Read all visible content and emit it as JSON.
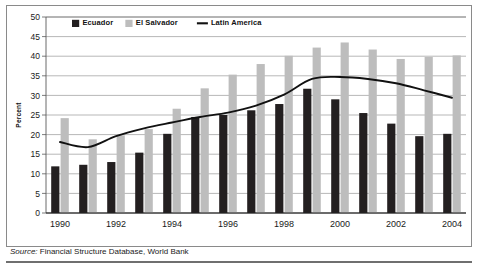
{
  "figure": {
    "source_prefix": "Source:",
    "source_text": " Financial Structure Database, World Bank"
  },
  "colors": {
    "ecuador": "#231f20",
    "el_salvador": "#bdbdbd",
    "latin_america": "#111111",
    "gridline": "#9a9a9a",
    "axis": "#5a5a5a",
    "frame": "#8a8a8a",
    "background": "#ffffff"
  },
  "chart_data": {
    "type": "bar",
    "title": "",
    "subtitle": "",
    "xlabel": "",
    "ylabel": "Percent",
    "ylim": [
      0,
      50
    ],
    "ytick_step": 5,
    "yticks": [
      0,
      5,
      10,
      15,
      20,
      25,
      30,
      35,
      40,
      45,
      50
    ],
    "ytick_labels": [
      "0",
      "5",
      "10",
      "15",
      "20",
      "25",
      "30",
      "35",
      "40",
      "45",
      "50"
    ],
    "grid": true,
    "legend_position": "top-left-inside",
    "categories": [
      1990,
      1991,
      1992,
      1993,
      1994,
      1995,
      1996,
      1997,
      1998,
      1999,
      2000,
      2001,
      2002,
      2003,
      2004
    ],
    "xtick_labels": [
      "1990",
      "",
      "1992",
      "",
      "1994",
      "",
      "1996",
      "",
      "1998",
      "",
      "2000",
      "",
      "2002",
      "",
      "2004"
    ],
    "xtick_labels_shown": [
      "1990",
      "1992",
      "1994",
      "1996",
      "1998",
      "2000",
      "2002",
      "2004"
    ],
    "series": [
      {
        "name": "Ecuador",
        "kind": "bar",
        "color": "#231f20",
        "values": [
          11.9,
          12.3,
          13.0,
          15.4,
          20.2,
          24.5,
          25.0,
          26.2,
          27.8,
          31.7,
          29.0,
          25.5,
          22.8,
          19.6,
          20.2
        ]
      },
      {
        "name": "El Salvador",
        "kind": "bar",
        "color": "#bdbdbd",
        "values": [
          24.2,
          18.8,
          19.8,
          21.4,
          26.6,
          31.8,
          35.3,
          38.0,
          40.1,
          42.2,
          43.5,
          41.7,
          39.3,
          39.8,
          40.2
        ]
      },
      {
        "name": "Latin America",
        "kind": "line",
        "color": "#111111",
        "values": [
          18.1,
          16.8,
          19.6,
          21.6,
          23.1,
          24.5,
          25.6,
          27.4,
          30.2,
          34.2,
          34.7,
          34.2,
          33.1,
          31.3,
          29.4
        ]
      }
    ]
  }
}
